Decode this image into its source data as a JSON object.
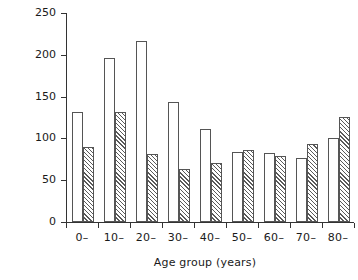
{
  "chart_data": {
    "type": "bar",
    "title": "",
    "xlabel": "Age group (years)",
    "ylabel": "Incidence rate per 1000",
    "categories": [
      "0–",
      "10–",
      "20–",
      "30–",
      "40–",
      "50–",
      "60–",
      "70–",
      "80–"
    ],
    "yticks": [
      0,
      50,
      100,
      150,
      200,
      250
    ],
    "ylim": [
      0,
      250
    ],
    "grid": false,
    "legend": "none",
    "series": [
      {
        "name": "open",
        "fill": "open",
        "values": [
          131,
          196,
          217,
          143,
          111,
          84,
          82,
          77,
          101
        ]
      },
      {
        "name": "hatched",
        "fill": "diagonal-hatch",
        "values": [
          90,
          131,
          81,
          64,
          71,
          86,
          79,
          93,
          126
        ]
      }
    ],
    "colors": {
      "outline": "#555555",
      "hatch": "#5a5a5a",
      "axis": "#333333",
      "background": "#ffffff"
    }
  }
}
